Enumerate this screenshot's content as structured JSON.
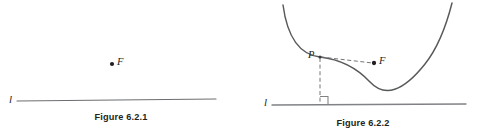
{
  "figure_set": {
    "background_color": "#ffffff",
    "ink_color": "#231f20",
    "stroke_color": "#58595b",
    "figures": [
      {
        "id": "figure-6-2-1",
        "caption": "Figure 6.2.1",
        "description": "A horizontal line l with a single point F above it",
        "labels": {
          "line_label": "l",
          "focus_label": "F"
        },
        "elements": {
          "line": {
            "name": "line-l",
            "x1": 17,
            "y1": 101,
            "x2": 216,
            "y2": 99
          },
          "focus_point": {
            "name": "point-f",
            "cx": 112,
            "cy": 64,
            "r": 2.1
          }
        }
      },
      {
        "id": "figure-6-2-2",
        "caption": "Figure 6.2.2",
        "description": "A parabola above a horizontal line l, with point P on the curve, a dashed segment from P to focus F, a dashed perpendicular from P down to l, and a right-angle marker at the foot",
        "labels": {
          "line_label": "l",
          "point_label": "P",
          "focus_label": "F"
        },
        "elements": {
          "line": {
            "name": "line-l",
            "x1": 30,
            "y1": 105,
            "x2": 224,
            "y2": 104
          },
          "parabola": {
            "name": "parabola-curve",
            "vertex_x": 128,
            "vertex_y": 82,
            "left_end_x": 41,
            "left_end_y": 5,
            "right_end_x": 210,
            "right_end_y": 3
          },
          "point_p": {
            "name": "point-p",
            "cx": 78,
            "cy": 57,
            "r": 1.6
          },
          "focus_point": {
            "name": "point-f",
            "cx": 132,
            "cy": 63,
            "r": 2.1
          },
          "dashed_focal_chord": {
            "name": "dashed-segment-p-to-f",
            "x1": 78,
            "y1": 57,
            "x2": 130,
            "y2": 63
          },
          "dashed_perpendicular": {
            "name": "dashed-segment-p-to-line",
            "x1": 78,
            "y1": 57,
            "x2": 78,
            "y2": 104
          },
          "right_angle_marker": {
            "name": "right-angle-marker",
            "x": 78,
            "y": 104,
            "size": 8
          }
        }
      }
    ]
  }
}
